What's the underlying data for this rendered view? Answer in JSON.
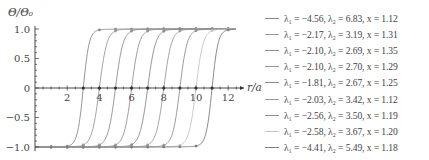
{
  "chart_data": {
    "type": "line",
    "title": "",
    "xlabel": "r/a",
    "ylabel": "Θ/Θ₀",
    "xlim": [
      0,
      12.8
    ],
    "ylim": [
      -1.05,
      1.05
    ],
    "x_ticks": [
      2,
      4,
      6,
      8,
      10,
      12
    ],
    "y_ticks": [
      -1.0,
      -0.5,
      0,
      0.5,
      1.0
    ],
    "y_tick_labels": [
      "−1.0",
      "−0.5",
      "0",
      "0.5",
      "1.0"
    ],
    "grid": false,
    "legend_position": "right",
    "markers_at": "integer r values",
    "series": [
      {
        "name": "λ1=−4.56, λ2=6.83, x=1.12",
        "lambda1": -4.56,
        "lambda2": 6.83,
        "x": 1.12,
        "zero_crossing": 3,
        "color": "#8a8a8a"
      },
      {
        "name": "λ1=−2.17, λ2=3.19, x=1.31",
        "lambda1": -2.17,
        "lambda2": 3.19,
        "x": 1.31,
        "zero_crossing": 4,
        "color": "#9a9a9a"
      },
      {
        "name": "λ1=−2.10, λ2=2.69, x=1.35",
        "lambda1": -2.1,
        "lambda2": 2.69,
        "x": 1.35,
        "zero_crossing": 5,
        "color": "#8f8f8f"
      },
      {
        "name": "λ1=−2.10, λ2=2.70, x=1.29",
        "lambda1": -2.1,
        "lambda2": 2.7,
        "x": 1.29,
        "zero_crossing": 6,
        "color": "#959595"
      },
      {
        "name": "λ1=−1.81, λ2=2.67, x=1.25",
        "lambda1": -1.81,
        "lambda2": 2.67,
        "x": 1.25,
        "zero_crossing": 7,
        "color": "#8c8c8c"
      },
      {
        "name": "λ1=−2.03, λ2=3.42, x=1.12",
        "lambda1": -2.03,
        "lambda2": 3.42,
        "x": 1.12,
        "zero_crossing": 8,
        "color": "#9b9b9b"
      },
      {
        "name": "λ1=−2.56, λ2=3.50, x=1.19",
        "lambda1": -2.56,
        "lambda2": 3.5,
        "x": 1.19,
        "zero_crossing": 9,
        "color": "#919191"
      },
      {
        "name": "λ1=−2.58, λ2=3.67, x=1.20",
        "lambda1": -2.58,
        "lambda2": 3.67,
        "x": 1.2,
        "zero_crossing": 10,
        "color": "#c4c4c4"
      },
      {
        "name": "λ1=−4.41, λ2=5.49, x=1.18",
        "lambda1": -4.41,
        "lambda2": 5.49,
        "x": 1.18,
        "zero_crossing": 11,
        "color": "#7f7f7f"
      }
    ]
  },
  "legend": {
    "items": [
      {
        "label": "λ₁ = −4.56,  λ₂ = 6.83,  x = 1.12"
      },
      {
        "label": "λ₁ = −2.17,  λ₂ = 3.19,  x = 1.31"
      },
      {
        "label": "λ₁ = −2.10,  λ₂ = 2.69,  x = 1.35"
      },
      {
        "label": "λ₁ = −2.10,  λ₂ = 2.70,  x = 1.29"
      },
      {
        "label": "λ₁ = −1.81,  λ₂ = 2.67,  x = 1.25"
      },
      {
        "label": "λ₁ = −2.03,  λ₂ = 3.42,  x = 1.12"
      },
      {
        "label": "λ₁ = −2.56,  λ₂ = 3.50,  x = 1.19"
      },
      {
        "label": "λ₁ = −2.58,  λ₂ = 3.67,  x = 1.20"
      },
      {
        "label": "λ₁ = −4.41,  λ₂ = 5.49,  x = 1.18"
      }
    ]
  }
}
